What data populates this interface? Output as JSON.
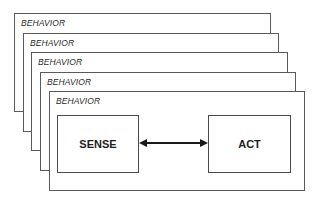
{
  "diagram": {
    "frames": [
      {
        "label": "BEHAVIOR"
      },
      {
        "label": "BEHAVIOR"
      },
      {
        "label": "BEHAVIOR"
      },
      {
        "label": "BEHAVIOR"
      },
      {
        "label": "BEHAVIOR"
      }
    ],
    "nodes": {
      "sense": {
        "label": "SENSE"
      },
      "act": {
        "label": "ACT"
      }
    },
    "edges": [
      {
        "from": "SENSE",
        "to": "ACT",
        "type": "bidirectional-arrow"
      }
    ],
    "colors": {
      "frame_border": "#5a5a5a",
      "box_border": "#4a4a4a",
      "arrow": "#1a1a1a",
      "text": "#1e1e1e"
    }
  }
}
